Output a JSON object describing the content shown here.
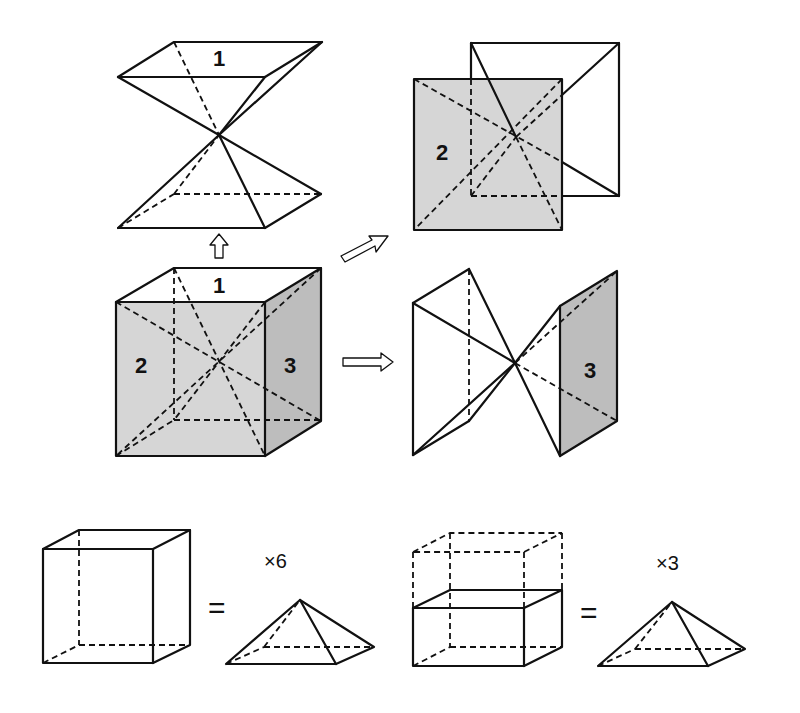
{
  "figure": {
    "type": "cube-dissection-into-pyramids",
    "top_left": {
      "label": "1",
      "description": "Two square pyramids (top face 1 and bottom face) meeting at cube center"
    },
    "center_left": {
      "face_labels": {
        "top": "1",
        "front": "2",
        "right": "3"
      },
      "description": "Cube with space diagonals meeting at center"
    },
    "top_right": {
      "label": "2",
      "description": "Pyramids on front face 2 and back face"
    },
    "middle_right": {
      "label": "3",
      "description": "Pyramids on right face 3 and left face"
    },
    "arrows": [
      "up",
      "up-right",
      "right"
    ]
  },
  "equations": [
    {
      "lhs": "cube",
      "equals": "=",
      "multiplier": "×6",
      "rhs": "pyramid"
    },
    {
      "lhs": "half-cube",
      "equals": "=",
      "multiplier": "×3",
      "rhs": "pyramid"
    }
  ]
}
